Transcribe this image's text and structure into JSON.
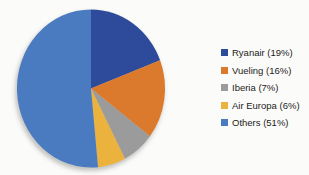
{
  "chart_data": {
    "type": "pie",
    "title": "",
    "labels": [
      "Ryanair",
      "Vueling",
      "Iberia",
      "Air Europa",
      "Others"
    ],
    "values": [
      19,
      16,
      7,
      6,
      51
    ],
    "legend_labels": [
      "Ryanair (19%)",
      "Vueling (16%)",
      "Iberia (7%)",
      "Air Europa (6%)",
      "Others (51%)"
    ],
    "colors": [
      "#2E4A9B",
      "#DB7A2D",
      "#9B9B9B",
      "#ECB23E",
      "#4A7BC0"
    ],
    "start_angle_deg": 0,
    "direction": "clockwise",
    "legend_position": "right",
    "background_color": "#FBFBF9",
    "legend_text_color": "#1B1B1B"
  }
}
